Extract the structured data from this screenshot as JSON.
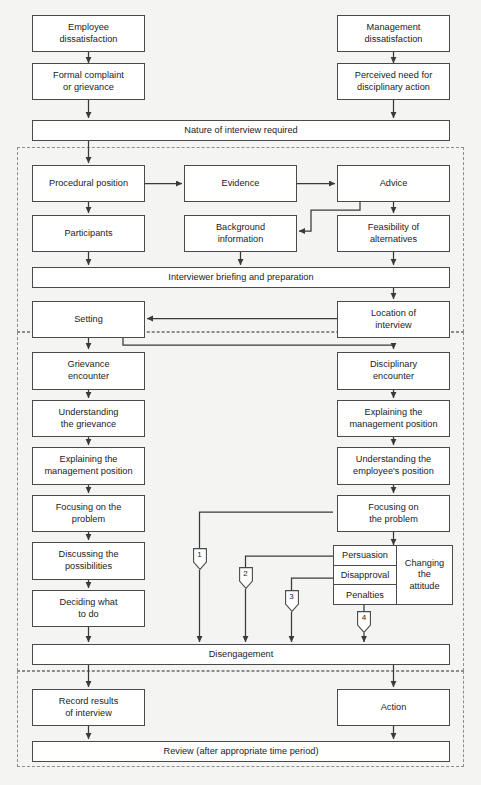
{
  "diagram": {
    "colors": {
      "background": "#f4f4f2",
      "node_fill": "#ffffff",
      "node_stroke": "#4a4a4a",
      "zone_stroke": "#8d8d8d",
      "text": "#1b1b1b"
    }
  },
  "stage_inputs": {
    "employee_dissatisfaction": "Employee\ndissatisfaction",
    "formal_complaint": "Formal complaint\nor grievance",
    "management_dissatisfaction": "Management\ndissatisfaction",
    "perceived_need": "Perceived need for\ndisciplinary action",
    "nature_of_interview": "Nature of interview required"
  },
  "stage_preparation": {
    "procedural_position": "Procedural position",
    "evidence": "Evidence",
    "advice": "Advice",
    "participants": "Participants",
    "background_information": "Background\ninformation",
    "feasibility_of_alternatives": "Feasibility of\nalternatives",
    "interviewer_briefing": "Interviewer briefing and preparation",
    "setting": "Setting",
    "location_of_interview": "Location of\ninterview"
  },
  "stage_encounter": {
    "grievance_encounter": "Grievance\nencounter",
    "understanding_the_grievance": "Understanding\nthe grievance",
    "explaining_management_position_left": "Explaining the\nmanagement position",
    "focusing_on_the_problem_left": "Focusing on the\nproblem",
    "discussing_the_possibilities": "Discussing the\npossibilities",
    "deciding_what_to_do": "Deciding what\nto do",
    "disciplinary_encounter": "Disciplinary\nencounter",
    "explaining_management_position_right": "Explaining the\nmanagement position",
    "understanding_employee_position": "Understanding the\nemployee's position",
    "focusing_on_the_problem_right": "Focusing on\nthe problem",
    "persuasion": "Persuasion",
    "disapproval": "Disapproval",
    "penalties": "Penalties",
    "changing_the_attitude": "Changing\nthe\nattitude",
    "disengagement": "Disengagement"
  },
  "stage_followup": {
    "record_results": "Record results\nof interview",
    "action": "Action",
    "review": "Review (after appropriate time period)"
  },
  "markers": [
    {
      "id": "marker-1",
      "label": "1"
    },
    {
      "id": "marker-2",
      "label": "2"
    },
    {
      "id": "marker-3",
      "label": "3"
    },
    {
      "id": "marker-4",
      "label": "4"
    }
  ]
}
